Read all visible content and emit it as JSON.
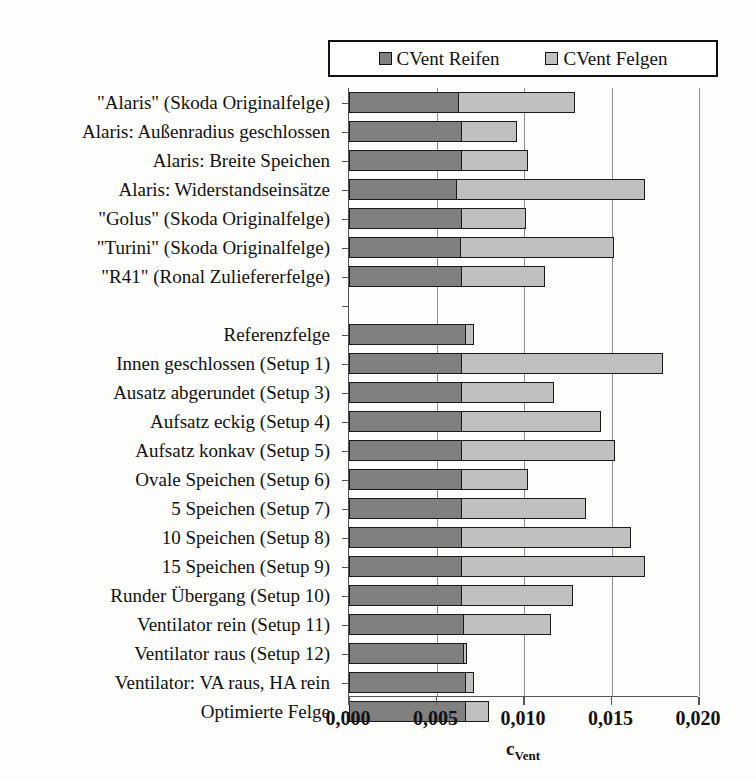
{
  "chart_data": {
    "type": "bar",
    "orientation": "horizontal",
    "stacked": true,
    "title": "",
    "xlabel": "c_Vent",
    "xlabel_base": "c",
    "xlabel_sub": "Vent",
    "ylabel": "",
    "xlim": [
      0.0,
      0.02
    ],
    "xticks": [
      0.0,
      0.005,
      0.01,
      0.015,
      0.02
    ],
    "xtick_labels": [
      "0,000",
      "0,005",
      "0,010",
      "0,015",
      "0,020"
    ],
    "grid": true,
    "grid_axis": "x",
    "legend_position": "top",
    "decimal_separator": ",",
    "categories": [
      "\"Alaris\" (Skoda Originalfelge)",
      "Alaris: Außenradius geschlossen",
      "Alaris: Breite Speichen",
      "Alaris: Widerstandseinsätze",
      "\"Golus\" (Skoda Originalfelge)",
      "\"Turini\" (Skoda Originalfelge)",
      "\"R41\" (Ronal Zuliefererfelge)",
      "",
      "Referenzfelge",
      "Innen geschlossen (Setup 1)",
      "Ausatz abgerundet (Setup 3)",
      "Aufsatz eckig (Setup 4)",
      "Aufsatz konkav (Setup 5)",
      "Ovale Speichen (Setup 6)",
      "5 Speichen (Setup 7)",
      "10 Speichen (Setup 8)",
      "15 Speichen (Setup 9)",
      "Runder Übergang (Setup 10)",
      "Ventilator rein (Setup 11)",
      "Ventilator raus (Setup 12)",
      "Ventilator: VA raus, HA rein",
      "Optimierte Felge"
    ],
    "series": [
      {
        "name": "CVent Reifen",
        "color": "#808080",
        "values": [
          0.0063,
          0.0065,
          0.0065,
          0.0062,
          0.0065,
          0.0064,
          0.0065,
          0,
          0.0067,
          0.0065,
          0.0065,
          0.0065,
          0.0065,
          0.0065,
          0.0065,
          0.0065,
          0.0065,
          0.0065,
          0.0066,
          0.0066,
          0.0067,
          0.0067
        ]
      },
      {
        "name": "CVent Felgen",
        "color": "#c0c0c0",
        "values": [
          0.0067,
          0.0032,
          0.0038,
          0.0108,
          0.0037,
          0.0088,
          0.0048,
          0,
          0.0005,
          0.0115,
          0.0053,
          0.008,
          0.0088,
          0.0038,
          0.0071,
          0.0097,
          0.0105,
          0.0064,
          0.005,
          0.0002,
          0.0005,
          0.0014
        ]
      }
    ],
    "totals": [
      0.013,
      0.0097,
      0.0103,
      0.017,
      0.0102,
      0.0152,
      0.0113,
      0,
      0.0072,
      0.018,
      0.0118,
      0.0145,
      0.0153,
      0.0103,
      0.0136,
      0.0162,
      0.017,
      0.0129,
      0.0116,
      0.0068,
      0.0072,
      0.0081
    ]
  },
  "legend": {
    "items": [
      {
        "label": "CVent Reifen",
        "color": "#808080"
      },
      {
        "label": "CVent Felgen",
        "color": "#c0c0c0"
      }
    ]
  },
  "colors": {
    "reifen": "#808080",
    "felgen": "#c0c0c0",
    "axis": "#555555",
    "gridline": "#8d8d8d",
    "bar_outline": "#1a1a1a",
    "background": "#fdfdfb"
  }
}
